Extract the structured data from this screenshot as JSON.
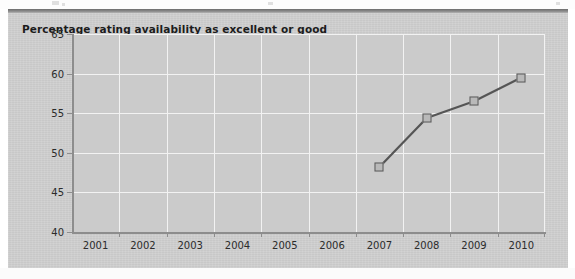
{
  "chart_title": "Percentage rating availability as excellent or good",
  "colors": {
    "panel_background": "#cfcfcf",
    "plot_background": "#cbcbcb",
    "gridline": "#f2f2f2",
    "axis": "#8d8d8d",
    "series_line": "#555555",
    "marker_fill": "#b9b9b9",
    "marker_border": "#5a5a5a",
    "title_text": "#1c1c1c",
    "top_rule": "#6e6e6e"
  },
  "chart_data": {
    "type": "line",
    "title": "Percentage rating availability as excellent or good",
    "xlabel": "",
    "ylabel": "",
    "categories": [
      "2001",
      "2002",
      "2003",
      "2004",
      "2005",
      "2006",
      "2007",
      "2008",
      "2009",
      "2010"
    ],
    "x_tick_labels": [
      "2001",
      "2002",
      "2003",
      "2004",
      "2005",
      "2006",
      "2007",
      "2008",
      "2009",
      "2010"
    ],
    "y_tick_labels": [
      "40",
      "45",
      "50",
      "55",
      "60",
      "65"
    ],
    "y_ticks": [
      40,
      45,
      50,
      55,
      60,
      65
    ],
    "ylim": [
      40,
      65
    ],
    "grid": true,
    "legend": false,
    "series": [
      {
        "name": "Percentage rating availability as excellent or good",
        "values": [
          null,
          null,
          null,
          null,
          null,
          null,
          48.2,
          54.4,
          56.5,
          59.5
        ],
        "marker": "square"
      }
    ],
    "points": [
      {
        "x": "2007",
        "y": 48.2
      },
      {
        "x": "2008",
        "y": 54.4
      },
      {
        "x": "2009",
        "y": 56.5
      },
      {
        "x": "2010",
        "y": 59.5
      }
    ]
  }
}
